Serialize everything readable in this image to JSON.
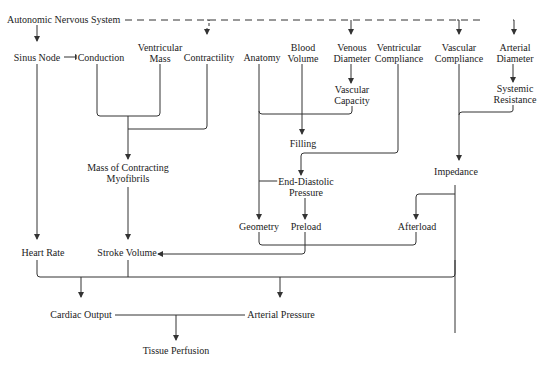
{
  "diagram": {
    "line_color": "#333333",
    "nodes": {
      "ans": "Autonomic Nervous System",
      "sinus_node": "Sinus Node",
      "conduction": "Conduction",
      "ventricular_mass": [
        "Ventricular",
        "Mass"
      ],
      "contractility": "Contractility",
      "anatomy": "Anatomy",
      "blood_volume": [
        "Blood",
        "Volume"
      ],
      "venous_diameter": [
        "Venous",
        "Diameter"
      ],
      "ventricular_compliance": [
        "Ventricular",
        "Compliance"
      ],
      "vascular_compliance": [
        "Vascular",
        "Compliance"
      ],
      "arterial_diameter": [
        "Arterial",
        "Diameter"
      ],
      "vascular_capacity": [
        "Vascular",
        "Capacity"
      ],
      "systemic_resistance": [
        "Systemic",
        "Resistance"
      ],
      "filling": "Filling",
      "mass_contracting": [
        "Mass of Contracting",
        "Myofibrils"
      ],
      "end_diastolic": [
        "End-Diastolic",
        "Pressure"
      ],
      "impedance": "Impedance",
      "geometry": "Geometry",
      "preload": "Preload",
      "afterload": "Afterload",
      "heart_rate": "Heart Rate",
      "stroke_volume": "Stroke Volume",
      "cardiac_output": "Cardiac Output",
      "arterial_pressure": "Arterial Pressure",
      "tissue_perfusion": "Tissue Perfusion"
    },
    "edges": [
      {
        "from": "Autonomic Nervous System",
        "to": "Sinus Node",
        "style": "solid"
      },
      {
        "from": "Autonomic Nervous System",
        "to": "Contractility",
        "style": "dashed"
      },
      {
        "from": "Autonomic Nervous System",
        "to": "Venous Diameter",
        "style": "dashed"
      },
      {
        "from": "Autonomic Nervous System",
        "to": "Vascular Compliance",
        "style": "dashed"
      },
      {
        "from": "Autonomic Nervous System",
        "to": "Arterial Diameter",
        "style": "dashed"
      },
      {
        "from": "Sinus Node",
        "to": "Conduction",
        "style": "solid"
      },
      {
        "from": "Sinus Node",
        "to": "Heart Rate",
        "style": "solid"
      },
      {
        "from": [
          "Conduction",
          "Ventricular Mass",
          "Contractility"
        ],
        "to": "Mass of Contracting Myofibrils",
        "style": "solid"
      },
      {
        "from": "Venous Diameter",
        "to": "Vascular Capacity",
        "style": "solid"
      },
      {
        "from": [
          "Blood Volume",
          "Anatomy",
          "Vascular Capacity"
        ],
        "to": "Filling",
        "style": "solid"
      },
      {
        "from": "Ventricular Compliance",
        "to": "End-Diastolic Pressure",
        "style": "solid"
      },
      {
        "from": "Arterial Diameter",
        "to": "Systemic Resistance",
        "style": "solid"
      },
      {
        "from": [
          "Vascular Compliance",
          "Systemic Resistance"
        ],
        "to": "Impedance",
        "style": "solid"
      },
      {
        "from": "Anatomy",
        "to": "Geometry",
        "style": "solid"
      },
      {
        "from": "End-Diastolic Pressure",
        "to": "Preload",
        "style": "solid"
      },
      {
        "from": "Impedance",
        "to": "Afterload",
        "style": "solid"
      },
      {
        "from": "Mass of Contracting Myofibrils",
        "to": "Stroke Volume",
        "style": "solid"
      },
      {
        "from": [
          "Geometry",
          "Preload",
          "Afterload"
        ],
        "to": "Stroke Volume",
        "style": "solid"
      },
      {
        "from": [
          "Heart Rate",
          "Stroke Volume"
        ],
        "to": "Cardiac Output",
        "style": "solid"
      },
      {
        "from": [
          "Heart Rate",
          "Stroke Volume",
          "Impedance"
        ],
        "to": "Arterial Pressure",
        "style": "solid"
      },
      {
        "from": [
          "Cardiac Output",
          "Arterial Pressure"
        ],
        "to": "Tissue Perfusion",
        "style": "solid"
      }
    ]
  }
}
